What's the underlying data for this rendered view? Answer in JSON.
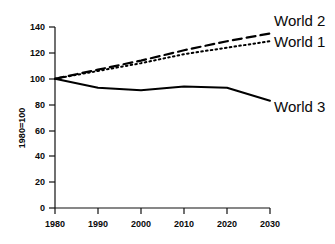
{
  "chart_data": {
    "type": "line",
    "title": "",
    "xlabel": "",
    "ylabel": "1980=100",
    "x": [
      1980,
      1990,
      2000,
      2010,
      2020,
      2030
    ],
    "xlim": [
      1980,
      2030
    ],
    "ylim": [
      0,
      140
    ],
    "xticks": [
      "1980",
      "1990",
      "2000",
      "2010",
      "2020",
      "2030"
    ],
    "yticks": [
      "0",
      "20",
      "40",
      "60",
      "80",
      "100",
      "120",
      "140"
    ],
    "grid": false,
    "legend_position": "right-inline",
    "series": [
      {
        "name": "World 2",
        "style": "dashed",
        "color": "#000000",
        "values": [
          100,
          107,
          114,
          122,
          129,
          135
        ]
      },
      {
        "name": "World 1",
        "style": "dotted",
        "color": "#000000",
        "values": [
          100,
          106,
          112,
          119,
          124,
          129
        ]
      },
      {
        "name": "World 3",
        "style": "solid",
        "color": "#000000",
        "values": [
          100,
          93,
          91,
          94,
          93,
          83
        ]
      }
    ]
  },
  "axis": {
    "ylabel": "1980=100",
    "yticks": [
      "140",
      "120",
      "100",
      "80",
      "60",
      "40",
      "20",
      "0"
    ],
    "xticks": [
      "1980",
      "1990",
      "2000",
      "2010",
      "2020",
      "2030"
    ]
  },
  "labels": {
    "world2": "World 2",
    "world1": "World 1",
    "world3": "World 3"
  }
}
